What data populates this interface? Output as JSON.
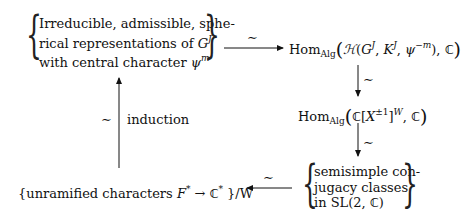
{
  "diagram": {
    "type": "commutative-diagram",
    "nodes": {
      "top_left": {
        "lines": [
          "Irreducible, admissible, sphe-",
          "rical representations of G^J",
          "with central character ψ^m"
        ],
        "line1": "Irreducible, admissible, sphe-",
        "line2_text": "rical representations of ",
        "line2_var": "G",
        "line2_sup": "J",
        "line3_text": "with central character ",
        "line3_var": "ψ",
        "line3_sup": "m"
      },
      "top_right": {
        "text": "Hom_Alg(H(G^J, K^J, ψ^{-m}), C)",
        "hom": "Hom",
        "hom_sub": "Alg",
        "open": "(",
        "H": "ℋ",
        "args_open": "(",
        "G": "G",
        "G_sup": "J",
        "comma1": ", ",
        "K": "K",
        "K_sup": "J",
        "comma2": ", ",
        "psi": "ψ",
        "psi_sup": "−m",
        "args_close": "), ",
        "C": "ℂ",
        "close": ")"
      },
      "middle_right": {
        "text": "Hom_Alg(C[X^{±1}]^W, C)",
        "hom": "Hom",
        "hom_sub": "Alg",
        "open": "(",
        "C1": "ℂ",
        "bracket_open": "[",
        "X": "X",
        "X_sup": "±1",
        "bracket_close": "]",
        "W_sup": "W",
        "comma": ", ",
        "C2": "ℂ",
        "close": ")"
      },
      "bottom_right": {
        "lines": [
          "semisimple con-",
          "jugacy classes",
          "in SL(2, C)"
        ],
        "line1": "semisimple con-",
        "line2": "jugacy classes",
        "line3_text": "in SL(2, ",
        "line3_C": "ℂ",
        "line3_close": ")"
      },
      "bottom_left": {
        "text": "{unramified characters F* → C* }/W",
        "open_brace": "{",
        "text_part": "unramified characters ",
        "F": "F",
        "F_sup": "*",
        "arrow": " → ",
        "C": "ℂ",
        "C_sup": "*",
        "tail": " }/W"
      }
    },
    "arrows": [
      {
        "from": "top_left",
        "to": "top_right",
        "direction": "right",
        "label": "∼"
      },
      {
        "from": "top_right",
        "to": "middle_right",
        "direction": "down",
        "label": "∼"
      },
      {
        "from": "middle_right",
        "to": "bottom_right",
        "direction": "down",
        "label": "∼"
      },
      {
        "from": "bottom_right",
        "to": "bottom_left",
        "direction": "left",
        "label": "∼"
      },
      {
        "from": "bottom_left",
        "to": "top_left",
        "direction": "up",
        "label": "∼",
        "side_label": "induction"
      }
    ],
    "labels": {
      "tilde": "∼",
      "induction": "induction",
      "brace_open": "{",
      "brace_close": "}"
    }
  }
}
